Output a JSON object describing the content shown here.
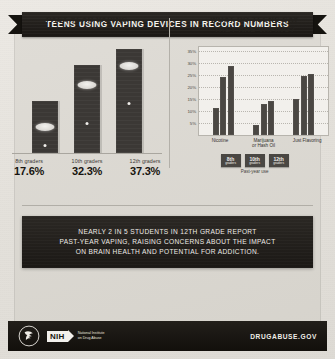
{
  "banner": {
    "title": "TEENS USING VAPING DEVICES IN RECORD NUMBERS"
  },
  "left_section": {
    "title": "PAST-YEAR VAPING",
    "bars": [
      {
        "grade": "8th graders",
        "percent": "17.6%"
      },
      {
        "grade": "10th graders",
        "percent": "32.3%"
      },
      {
        "grade": "12th graders",
        "percent": "37.3%"
      }
    ]
  },
  "right_section": {
    "title_line1": "WHAT DO TEENS SAY",
    "title_line2": "THEY ARE VAPING?",
    "legend": [
      {
        "grade": "8th",
        "sub": "graders"
      },
      {
        "grade": "10th",
        "sub": "graders"
      },
      {
        "grade": "12th",
        "sub": "graders"
      }
    ],
    "legend_caption": "Past-year use"
  },
  "callout": {
    "line1": "NEARLY 2 IN 5 STUDENTS IN 12TH GRADE REPORT",
    "line2": "PAST-YEAR VAPING, RAISING CONCERNS ABOUT THE IMPACT",
    "line3": "ON BRAIN HEALTH AND POTENTIAL FOR ADDICTION."
  },
  "footer": {
    "nih": "NIH",
    "nih_sub_line1": "National Institute",
    "nih_sub_line2": "on Drug Abuse",
    "website": "DRUGABUSE.GOV"
  },
  "colors": {
    "ink": "#221f1b",
    "bar": "#3b3835",
    "paper": "#dfdcd6"
  },
  "chart_data": [
    {
      "type": "bar",
      "title": "PAST-YEAR VAPING",
      "categories": [
        "8th graders",
        "10th graders",
        "12th graders"
      ],
      "values": [
        17.6,
        32.3,
        37.3
      ],
      "xlabel": "",
      "ylabel": "",
      "ylim": [
        0,
        40
      ],
      "grid": false,
      "legend": "none",
      "data_labels": [
        "17.6%",
        "32.3%",
        "37.3%"
      ]
    },
    {
      "type": "bar",
      "title": "WHAT DO TEENS SAY THEY ARE VAPING?",
      "categories": [
        "Nicotine",
        "Marijuana or Hash Oil",
        "Just Flavoring"
      ],
      "series": [
        {
          "name": "8th graders",
          "values": [
            11.0,
            4.0,
            15.0
          ]
        },
        {
          "name": "10th graders",
          "values": [
            24.0,
            13.0,
            24.5
          ]
        },
        {
          "name": "12th graders",
          "values": [
            29.0,
            14.0,
            25.5
          ]
        }
      ],
      "xlabel": "",
      "ylabel": "",
      "ylim": [
        0,
        37
      ],
      "yticks": [
        5,
        10,
        15,
        20,
        25,
        30,
        35
      ],
      "ytick_labels": [
        "5%",
        "10%",
        "15%",
        "20%",
        "25%",
        "30%",
        "35%"
      ],
      "grid": true,
      "legend": "bottom",
      "legend_caption": "Past-year use"
    }
  ]
}
